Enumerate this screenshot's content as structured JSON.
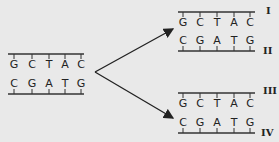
{
  "diagram": {
    "parent": {
      "top_strand": [
        "G",
        "C",
        "T",
        "A",
        "C"
      ],
      "bottom_strand": [
        "C",
        "G",
        "A",
        "T",
        "G"
      ]
    },
    "products": [
      {
        "label": "I",
        "strand": [
          "G",
          "C",
          "T",
          "A",
          "C"
        ]
      },
      {
        "label": "II",
        "strand": [
          "C",
          "G",
          "A",
          "T",
          "G"
        ]
      },
      {
        "label": "III",
        "strand": [
          "G",
          "C",
          "T",
          "A",
          "C"
        ]
      },
      {
        "label": "IV",
        "strand": [
          "C",
          "G",
          "A",
          "T",
          "G"
        ]
      }
    ],
    "colors": {
      "background": "#e9e9e9",
      "ink": "#222222"
    }
  }
}
